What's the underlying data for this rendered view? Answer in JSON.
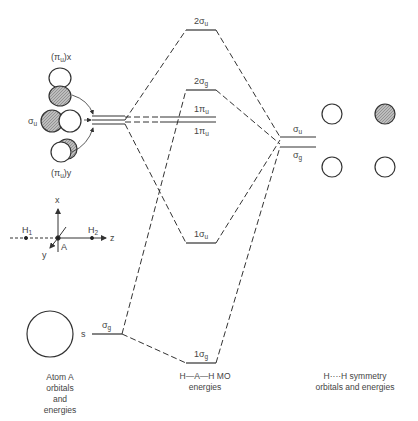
{
  "atom_a": {
    "orbitals": {
      "pi_u_x": "(π",
      "pi_u_x_sub": "u",
      "pi_u_x_tail": ")x",
      "sigma_u": "σ",
      "sigma_u_sub": "u",
      "pi_u_y": "(π",
      "pi_u_y_sub": "u",
      "pi_u_y_tail": ")y",
      "s_label": "s",
      "s_sym": "σ",
      "s_sym_sub": "g"
    },
    "axes": {
      "x": "x",
      "y": "y",
      "z": "z",
      "h1": "H",
      "h1_sub": "1",
      "h2": "H",
      "h2_sub": "2",
      "center": "A"
    },
    "caption": [
      "Atom A",
      "orbitals",
      "and",
      "energies"
    ]
  },
  "mo_levels": [
    {
      "id": "2sigma_u",
      "num": "2",
      "sym": "σ",
      "sub": "u"
    },
    {
      "id": "2sigma_g",
      "num": "2",
      "sym": "σ",
      "sub": "g"
    },
    {
      "id": "1pi_u_a",
      "num": "1",
      "sym": "π",
      "sub": "u"
    },
    {
      "id": "1pi_u_b",
      "num": "1",
      "sym": "π",
      "sub": "u"
    },
    {
      "id": "1sigma_u",
      "num": "1",
      "sym": "σ",
      "sub": "u"
    },
    {
      "id": "1sigma_g",
      "num": "1",
      "sym": "σ",
      "sub": "g"
    }
  ],
  "mo_caption": [
    "H—A—H  MO",
    "energies"
  ],
  "hh": {
    "sigma_u": "σ",
    "sigma_u_sub": "u",
    "sigma_g": "σ",
    "sigma_g_sub": "g",
    "caption": [
      "H····H  symmetry",
      "orbitals and energies"
    ]
  }
}
